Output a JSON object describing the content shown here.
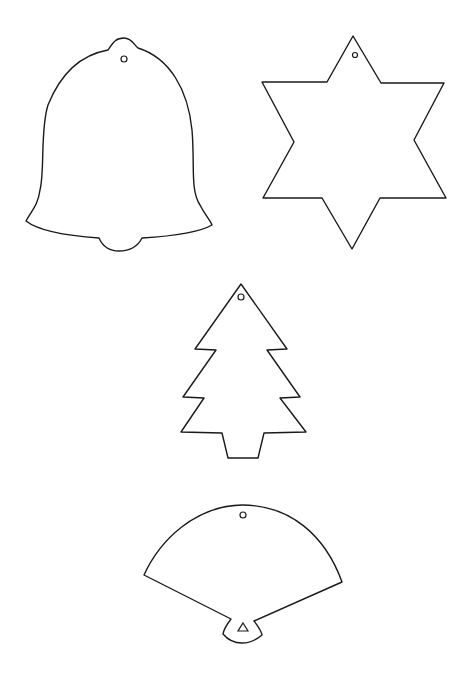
{
  "page": {
    "background": "#ffffff",
    "line_color": "#1a1a1a"
  },
  "ornaments": [
    {
      "name": "Bell",
      "shape": "bell-icon",
      "has_hanging_hole": true
    },
    {
      "name": "Six-pointed star",
      "shape": "star-icon",
      "has_hanging_hole": true
    },
    {
      "name": "Christmas tree",
      "shape": "tree-icon",
      "has_hanging_hole": true
    },
    {
      "name": "Fan",
      "shape": "fan-icon",
      "has_hanging_hole": true
    }
  ]
}
